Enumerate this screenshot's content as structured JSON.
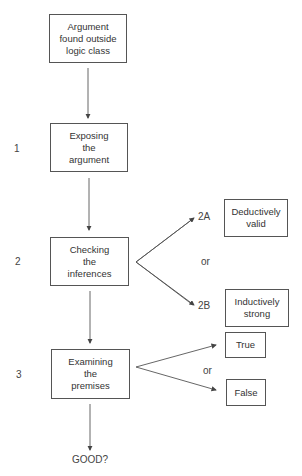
{
  "diagram": {
    "start": {
      "lines": [
        "Argument",
        "found outside",
        "logic class"
      ]
    },
    "steps": [
      {
        "number": "1",
        "lines": [
          "Exposing",
          "the",
          "argument"
        ]
      },
      {
        "number": "2",
        "lines": [
          "Checking",
          "the",
          "inferences"
        ]
      },
      {
        "number": "3",
        "lines": [
          "Examining",
          "the",
          "premises"
        ]
      }
    ],
    "inference_branches": [
      {
        "label": "2A",
        "lines": [
          "Deductively",
          "valid"
        ]
      },
      {
        "label": "2B",
        "lines": [
          "Inductively",
          "strong"
        ]
      }
    ],
    "inference_or": "or",
    "premise_branches": [
      {
        "lines": [
          "True"
        ]
      },
      {
        "lines": [
          "False"
        ]
      }
    ],
    "premise_or": "or",
    "end": "GOOD?"
  }
}
